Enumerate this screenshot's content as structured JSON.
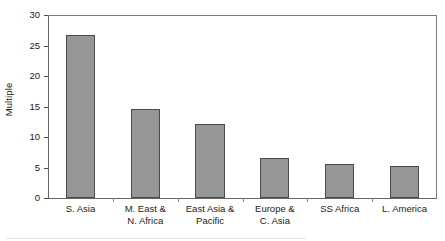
{
  "chart_data": {
    "type": "bar",
    "title": "",
    "xlabel": "",
    "ylabel": "Multiple",
    "categories": [
      "S. Asia",
      "M. East & N. Africa",
      "East Asia & Pacific",
      "Europe & C. Asia",
      "SS Africa",
      "L. America"
    ],
    "category_lines": [
      [
        "S. Asia"
      ],
      [
        "M. East &",
        "N. Africa"
      ],
      [
        "East Asia &",
        "Pacific"
      ],
      [
        "Europe &",
        "C. Asia"
      ],
      [
        "SS Africa"
      ],
      [
        "L. America"
      ]
    ],
    "values": [
      26.8,
      14.6,
      12.1,
      6.5,
      5.6,
      5.3
    ],
    "ylim": [
      0,
      30
    ],
    "yticks": [
      0,
      5,
      10,
      15,
      20,
      25,
      30
    ],
    "ytick_labels": [
      "0",
      "5",
      "10",
      "15",
      "20",
      "25",
      "30"
    ],
    "grid": false,
    "legend": false,
    "legend_position": "none",
    "bar_fill_color": "#969696",
    "bar_border_color": "#4a4a4a",
    "axis_color": "#666666",
    "background_color": "#ffffff",
    "text_color": "#1a1a1a"
  }
}
